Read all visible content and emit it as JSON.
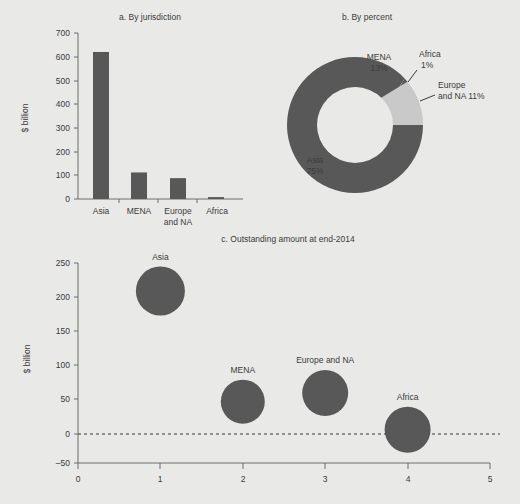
{
  "figure": {
    "background_color": "#e9e9e7",
    "dark_color": "#585858",
    "light_color": "#c9c9c9",
    "axis_color": "#6d6d6d"
  },
  "chart_data": [
    {
      "type": "bar",
      "panel": "a",
      "title": "a. By jurisdiction",
      "xlabel": "",
      "ylabel": "$ billion",
      "categories": [
        "Asia",
        "MENA",
        "Europe and NA",
        "Africa"
      ],
      "values": [
        620,
        112,
        88,
        8
      ],
      "ylim": [
        0,
        700
      ],
      "yticks": [
        0,
        100,
        200,
        300,
        400,
        500,
        600,
        700
      ],
      "ytick_labels": [
        "0",
        "100",
        "200",
        "300",
        "400",
        "500",
        "600",
        "700"
      ],
      "grid": false,
      "legend": "none",
      "bar_color": "#585858"
    },
    {
      "type": "pie",
      "panel": "b",
      "title": "b. By percent",
      "donut": true,
      "categories": [
        "MENA",
        "Africa",
        "Europe and NA",
        "Asia"
      ],
      "values": [
        13,
        1,
        11,
        75
      ],
      "labels": [
        "MENA\n13%",
        "Africa\n1%",
        "Europe\nand NA 11%",
        "Asia\n75%"
      ],
      "slice_colors": [
        "#585858",
        "#585858",
        "#c9c9c9",
        "#585858"
      ],
      "legend": "none",
      "annotations": [
        {
          "text_line1": "MENA",
          "text_line2": "13%",
          "placement": "inside"
        },
        {
          "text_line1": "Africa",
          "text_line2": "1%",
          "placement": "outside-right"
        },
        {
          "text_line1": "Europe",
          "text_line2": "and NA 11%",
          "placement": "outside-right"
        },
        {
          "text_line1": "Asia",
          "text_line2": "75%",
          "placement": "inside"
        }
      ]
    },
    {
      "type": "scatter",
      "panel": "c",
      "title": "c. Outstanding amount at end-2014",
      "xlabel": "",
      "ylabel": "$ billion",
      "xlim": [
        0,
        5
      ],
      "ylim": [
        -50,
        250
      ],
      "xticks": [
        0,
        1,
        2,
        3,
        4,
        5
      ],
      "xtick_labels": [
        "0",
        "1",
        "2",
        "3",
        "4",
        "5"
      ],
      "yticks": [
        -50,
        0,
        50,
        100,
        150,
        200,
        250
      ],
      "ytick_labels": [
        "–50",
        "0",
        "50",
        "100",
        "150",
        "200",
        "250"
      ],
      "grid": false,
      "zero_line": true,
      "legend": "none",
      "marker_color": "#585858",
      "points": [
        {
          "label": "Asia",
          "x": 1,
          "y": 208,
          "size_px": 49
        },
        {
          "label": "MENA",
          "x": 2,
          "y": 42,
          "size_px": 44
        },
        {
          "label": "Europe and NA",
          "x": 3,
          "y": 55,
          "size_px": 46
        },
        {
          "label": "Africa",
          "x": 4,
          "y": 0,
          "size_px": 46
        }
      ]
    }
  ]
}
